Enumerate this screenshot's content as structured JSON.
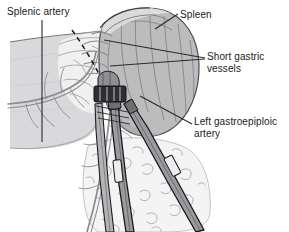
{
  "figure": {
    "background_color": "#ffffff",
    "width": 289,
    "height": 232
  },
  "labels": {
    "splenic_artery": "Splenic artery",
    "spleen": "Spleen",
    "short_gastric_line1": "Short gastric",
    "short_gastric_line2": "vessels",
    "left_gastroepiploic_line1": "Left gastroepiploic",
    "left_gastroepiploic_line2": "artery"
  },
  "colors": {
    "ink": "#19191b",
    "leader_line": "#2a2a2c",
    "spleen_fill": "#b9b9bb",
    "spleen_shade": "#9d9da0",
    "stomach_fill": "#d8d8da",
    "tissue_fill": "#eeeeef",
    "omentum_fill": "#f2f2f3",
    "vessel_stroke": "#8a8a8e",
    "instrument_fill": "#8f8f93",
    "instrument_dark": "#3a3a3d",
    "clamp_dark": "#2e2e31"
  },
  "anatomy": {
    "structures": [
      {
        "name": "spleen",
        "description": "large kidney-bean shaped organ, upper right, mid-gray with curved capsular shading lines"
      },
      {
        "name": "stomach",
        "description": "flat gray shaded body occupying the left side"
      },
      {
        "name": "greater-omentum",
        "description": "pale tissue at lower center with squiggly fat lobule texture"
      },
      {
        "name": "short-gastric-vessels",
        "description": "fine vessels bridging stomach to spleen at the upper hilum"
      },
      {
        "name": "left-gastroepiploic-artery",
        "description": "vessel running down along the greater curvature"
      },
      {
        "name": "splenic-artery",
        "description": "vessel along the superior border of the stomach"
      },
      {
        "name": "dissection-plane",
        "description": "dashed curved line marking the plane of division"
      }
    ],
    "instruments": [
      {
        "name": "clamp-left",
        "description": "long surgical clamp entering from lower left toward the hilum"
      },
      {
        "name": "clamp-right",
        "description": "long surgical clamp entering from lower right toward the hilum"
      },
      {
        "name": "ligature-block",
        "description": "dark clamped/ligated vessel bundle at the convergence point"
      }
    ]
  },
  "leaders": {
    "splenic_artery": "vertical line descending from the label to the stomach superior border",
    "spleen": "short diagonal line from the label down-left to the spleen capsule",
    "short_gastric": "two converging lines from the label left to the short gastric vessels",
    "left_gastroepiploic": "diagonal line from the label down-left to the gastroepiploic artery"
  }
}
